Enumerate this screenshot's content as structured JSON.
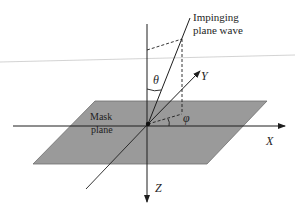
{
  "labels": {
    "wave_line1": "Impinging",
    "wave_line2": "plane wave",
    "mask_line1": "Mask",
    "mask_line2": "plane",
    "theta": "θ",
    "phi": "φ",
    "x_axis": "X",
    "y_axis": "Y",
    "z_axis": "Z"
  },
  "colors": {
    "plane_fill": "#9a9a9a",
    "plane_edge": "#6e6e6e",
    "line": "#1e1e1e",
    "background": "#ffffff"
  }
}
